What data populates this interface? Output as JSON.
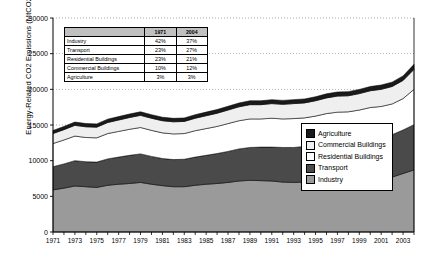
{
  "chart_data": {
    "type": "area",
    "title": "",
    "xlabel": "",
    "ylabel": "Energy-Related CO2 Emissions (MtCO2)",
    "stacked": true,
    "grid": true,
    "legend_position": "right-inside",
    "xlim": [
      1971,
      2004
    ],
    "ylim": [
      0,
      30000
    ],
    "yticks": [
      0,
      5000,
      10000,
      15000,
      20000,
      25000,
      30000
    ],
    "ytick_labels": [
      "0",
      "5000",
      "10000",
      "15000",
      "20000",
      "25000",
      "30000"
    ],
    "xticks": [
      1971,
      1973,
      1975,
      1977,
      1979,
      1981,
      1983,
      1985,
      1987,
      1989,
      1991,
      1993,
      1995,
      1997,
      1999,
      2001,
      2003
    ],
    "xtick_labels": [
      "1971",
      "1973",
      "1975",
      "1977",
      "1979",
      "1981",
      "1983",
      "1985",
      "1987",
      "1989",
      "1991",
      "1993",
      "1995",
      "1997",
      "1999",
      "2001",
      "2003"
    ],
    "x": [
      1971,
      1972,
      1973,
      1974,
      1975,
      1976,
      1977,
      1978,
      1979,
      1980,
      1981,
      1982,
      1983,
      1984,
      1985,
      1986,
      1987,
      1988,
      1989,
      1990,
      1991,
      1992,
      1993,
      1994,
      1995,
      1996,
      1997,
      1998,
      1999,
      2000,
      2001,
      2002,
      2003,
      2004
    ],
    "series": [
      {
        "name": "Industry",
        "color": "#9a9a9a",
        "values": [
          5900,
          6150,
          6450,
          6350,
          6250,
          6550,
          6700,
          6800,
          6950,
          6700,
          6500,
          6350,
          6350,
          6550,
          6700,
          6800,
          6950,
          7150,
          7250,
          7200,
          7150,
          7000,
          6950,
          7000,
          7100,
          7200,
          7300,
          7250,
          7300,
          7450,
          7500,
          7700,
          8200,
          8700
        ]
      },
      {
        "name": "Transport",
        "color": "#4a4a4a",
        "values": [
          3250,
          3400,
          3550,
          3500,
          3550,
          3700,
          3800,
          3950,
          4000,
          3900,
          3800,
          3800,
          3850,
          3950,
          4050,
          4200,
          4350,
          4500,
          4600,
          4700,
          4750,
          4850,
          4900,
          5000,
          5100,
          5250,
          5400,
          5500,
          5650,
          5800,
          5850,
          5950,
          6100,
          6350
        ]
      },
      {
        "name": "Residential Buildings",
        "color": "#ffffff",
        "values": [
          3250,
          3350,
          3450,
          3400,
          3400,
          3550,
          3600,
          3650,
          3700,
          3650,
          3600,
          3600,
          3600,
          3700,
          3750,
          3800,
          3900,
          3950,
          4000,
          3950,
          4050,
          4000,
          4050,
          4000,
          4050,
          4150,
          4100,
          4100,
          4150,
          4200,
          4250,
          4300,
          4400,
          4950
        ]
      },
      {
        "name": "Commercial Buildings",
        "color": "#efefef",
        "values": [
          1400,
          1450,
          1500,
          1500,
          1500,
          1550,
          1600,
          1650,
          1700,
          1700,
          1700,
          1700,
          1700,
          1750,
          1800,
          1850,
          1900,
          1950,
          2000,
          2000,
          2050,
          2050,
          2100,
          2100,
          2150,
          2200,
          2250,
          2250,
          2300,
          2350,
          2400,
          2450,
          2550,
          2800
        ]
      },
      {
        "name": "Agriculture",
        "color": "#1a1a1a",
        "values": [
          430,
          445,
          460,
          455,
          455,
          470,
          480,
          490,
          500,
          495,
          490,
          485,
          485,
          495,
          505,
          515,
          525,
          535,
          545,
          545,
          550,
          550,
          555,
          555,
          560,
          570,
          575,
          575,
          585,
          595,
          600,
          610,
          630,
          700
        ]
      }
    ]
  },
  "share_table": {
    "header": [
      "",
      "1971",
      "2004"
    ],
    "rows": [
      {
        "category": "Industry",
        "y1971": "42%",
        "y2004": "37%"
      },
      {
        "category": "Transport",
        "y1971": "23%",
        "y2004": "27%"
      },
      {
        "category": "Residential Buildings",
        "y1971": "23%",
        "y2004": "21%"
      },
      {
        "category": "Commercial Buildings",
        "y1971": "10%",
        "y2004": "12%"
      },
      {
        "category": "Agriculture",
        "y1971": "3%",
        "y2004": "3%"
      }
    ]
  },
  "legend": {
    "items": [
      {
        "label": "Agriculture",
        "color": "#1a1a1a"
      },
      {
        "label": "Commercial Buildings",
        "color": "#efefef"
      },
      {
        "label": "Residential Buildings",
        "color": "#ffffff"
      },
      {
        "label": "Transport",
        "color": "#4a4a4a"
      },
      {
        "label": "Industry",
        "color": "#9a9a9a"
      }
    ]
  }
}
